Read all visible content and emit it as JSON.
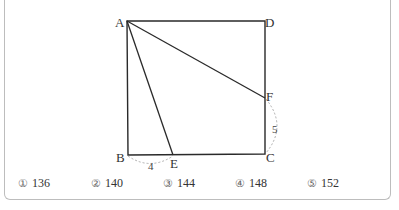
{
  "figure": {
    "points": {
      "A": {
        "label": "A"
      },
      "B": {
        "label": "B"
      },
      "C": {
        "label": "C"
      },
      "D": {
        "label": "D"
      },
      "E": {
        "label": "E"
      },
      "F": {
        "label": "F"
      }
    },
    "measures": {
      "BE": "4",
      "FC": "5"
    }
  },
  "choices": [
    {
      "mark": "①",
      "value": "136"
    },
    {
      "mark": "②",
      "value": "140"
    },
    {
      "mark": "③",
      "value": "144"
    },
    {
      "mark": "④",
      "value": "148"
    },
    {
      "mark": "⑤",
      "value": "152"
    }
  ]
}
